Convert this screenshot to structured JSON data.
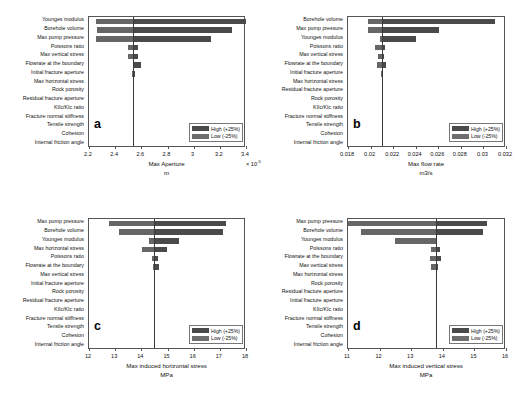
{
  "figure": {
    "legend": {
      "high_label": "High (+25%)",
      "low_label": "Low (-25%)",
      "high_color": "#4a4a4a",
      "low_color": "#6e6e6e"
    }
  },
  "chart_data": [
    {
      "type": "bar",
      "orientation": "horizontal",
      "panel_label": "a",
      "title": "",
      "xlabel": "Max Aperture",
      "unit": "m",
      "exponent": "× 10",
      "exponent_sup": "-5",
      "xlim": [
        2.2,
        3.4
      ],
      "xticks": [
        2.2,
        2.4,
        2.6,
        2.8,
        3.0,
        3.2,
        3.4
      ],
      "xticklabels": [
        "2.2",
        "2.4",
        "2.6",
        "2.8",
        "3",
        "3.2",
        "3.4"
      ],
      "baseline": 2.54,
      "grid": false,
      "legend_position": "lower right",
      "categories": [
        "Younges modulus",
        "Borehole volume",
        "Max pump pressure",
        "Poissons ratio",
        "Max vertical stress",
        "Flowrate at the boundary",
        "Initial fracture aperture",
        "Max horizontal stress",
        "Rock porosity",
        "Residual fracture aperture",
        "KIIc/KIc ratio",
        "Fracture normal stiffness",
        "Tensile strength",
        "Cohesion",
        "Internal friction angle"
      ],
      "series": [
        {
          "name": "Low (-25%)",
          "values": [
            2.255,
            2.26,
            2.255,
            2.495,
            2.5,
            2.535,
            2.532,
            2.54,
            2.54,
            2.54,
            2.54,
            2.54,
            2.54,
            2.54,
            2.54
          ]
        },
        {
          "name": "High (+25%)",
          "values": [
            3.4,
            3.29,
            3.13,
            2.575,
            2.575,
            2.6,
            2.548,
            2.54,
            2.54,
            2.54,
            2.54,
            2.54,
            2.54,
            2.54,
            2.54
          ]
        }
      ]
    },
    {
      "type": "bar",
      "orientation": "horizontal",
      "panel_label": "b",
      "title": "",
      "xlabel": "Max flow rate",
      "unit": "m3/s",
      "exponent": "",
      "exponent_sup": "",
      "xlim": [
        0.018,
        0.032
      ],
      "xticks": [
        0.018,
        0.02,
        0.022,
        0.024,
        0.026,
        0.028,
        0.03,
        0.032
      ],
      "xticklabels": [
        "0.018",
        "0.02",
        "0.022",
        "0.024",
        "0.026",
        "0.028",
        "0.03",
        "0.032"
      ],
      "baseline": 0.021,
      "grid": false,
      "legend_position": "lower right",
      "categories": [
        "Borehole volume",
        "Max pump pressure",
        "Younges modulus",
        "Poissons ratio",
        "Max vertical stress",
        "Flowrate at the boundary",
        "Initial fracture aperture",
        "Max horizontal stress",
        "Residual fracture aperture",
        "Rock porosity",
        "KIIc/KIc ratio",
        "Fracture normal stiffness",
        "Tensile strength",
        "Cohesion",
        "Internal friction angle"
      ],
      "series": [
        {
          "name": "Low (-25%)",
          "values": [
            0.0198,
            0.0198,
            0.0208,
            0.0204,
            0.0207,
            0.0206,
            0.0209,
            0.021,
            0.021,
            0.021,
            0.021,
            0.021,
            0.021,
            0.021,
            0.021
          ]
        },
        {
          "name": "High (+25%)",
          "values": [
            0.031,
            0.0261,
            0.024,
            0.0213,
            0.0212,
            0.0214,
            0.0211,
            0.021,
            0.021,
            0.021,
            0.021,
            0.021,
            0.021,
            0.021,
            0.021
          ]
        }
      ]
    },
    {
      "type": "bar",
      "orientation": "horizontal",
      "panel_label": "c",
      "title": "",
      "xlabel": "Max induced horizontal stress",
      "unit": "MPa",
      "exponent": "",
      "exponent_sup": "",
      "xlim": [
        12,
        18
      ],
      "xticks": [
        12,
        13,
        14,
        15,
        16,
        17,
        18
      ],
      "xticklabels": [
        "12",
        "13",
        "14",
        "15",
        "16",
        "17",
        "18"
      ],
      "baseline": 14.5,
      "grid": false,
      "legend_position": "lower right",
      "categories": [
        "Max pump pressure",
        "Borehole volume",
        "Younges modulus",
        "Max horizontal stress",
        "Poissons ratio",
        "Flowrate at the boundary",
        "Max vertical stress",
        "Initial fracture aperture",
        "Rock porosity",
        "Residual fracture aperture",
        "KIIc/KIc ratio",
        "Fracture normal stiffness",
        "Tensile strength",
        "Cohesion",
        "Internal friction angle"
      ],
      "series": [
        {
          "name": "Low (-25%)",
          "values": [
            12.78,
            13.15,
            14.28,
            14.02,
            14.42,
            14.45,
            14.48,
            14.5,
            14.5,
            14.5,
            14.5,
            14.5,
            14.5,
            14.5,
            14.5
          ]
        },
        {
          "name": "High (+25%)",
          "values": [
            17.25,
            17.12,
            15.45,
            15.0,
            14.62,
            14.68,
            14.52,
            14.5,
            14.5,
            14.5,
            14.5,
            14.5,
            14.5,
            14.5,
            14.5
          ]
        }
      ]
    },
    {
      "type": "bar",
      "orientation": "horizontal",
      "panel_label": "d",
      "title": "",
      "xlabel": "Max induced vertical stress",
      "unit": "MPa",
      "exponent": "",
      "exponent_sup": "",
      "xlim": [
        11,
        16
      ],
      "xticks": [
        11,
        12,
        13,
        14,
        15,
        16
      ],
      "xticklabels": [
        "11",
        "12",
        "13",
        "14",
        "15",
        "16"
      ],
      "baseline": 13.78,
      "grid": false,
      "legend_position": "lower right",
      "categories": [
        "Max pump pressure",
        "Borehole volume",
        "Younges modulus",
        "Poissons ratio",
        "Flowrate at the boundary",
        "Max vertical stress",
        "Max horizontal stress",
        "Rock porosity",
        "Residual fracture aperture",
        "Initial fracture aperture",
        "KIIc/KIc ratio",
        "Fracture normal stiffness",
        "Tensile strength",
        "Cohesion",
        "Internal friction angle"
      ],
      "series": [
        {
          "name": "Low (-25%)",
          "values": [
            11.0,
            11.42,
            12.5,
            13.62,
            13.6,
            13.62,
            13.78,
            13.78,
            13.78,
            13.78,
            13.78,
            13.78,
            13.78,
            13.78,
            13.78
          ]
        },
        {
          "name": "High (+25%)",
          "values": [
            15.4,
            15.28,
            13.82,
            13.9,
            13.95,
            13.84,
            13.78,
            13.78,
            13.78,
            13.78,
            13.78,
            13.78,
            13.78,
            13.78,
            13.78
          ]
        }
      ]
    }
  ]
}
